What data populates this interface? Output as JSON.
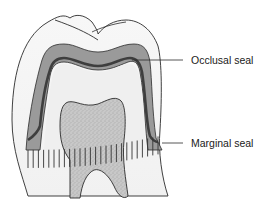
{
  "diagram": {
    "labels": [
      {
        "id": "occlusal",
        "text": "Occlusal seal"
      },
      {
        "id": "marginal",
        "text": "Marginal seal"
      }
    ],
    "parts": {
      "crown": "outer tooth crown",
      "seal_layer": "grey sealing layer",
      "inner_line": "dark inner seal line",
      "core": "stippled inner tooth (pulp/dentin)",
      "margin_band": "hatched marginal band"
    },
    "colors": {
      "outline": "#2b2b2b",
      "crown_fill": "#f4f4f4",
      "seal_fill": "#9a9a9a",
      "inner_line": "#4a4a4a",
      "core_fill": "#c8c8c8",
      "hatch": "#333333"
    }
  }
}
